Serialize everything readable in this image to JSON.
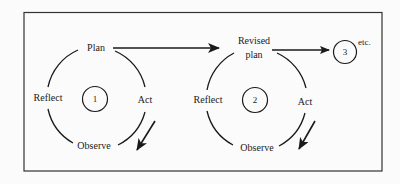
{
  "diagram": {
    "type": "action-research-spiral",
    "colors": {
      "stroke": "#1a1a1a",
      "background": "#fbfbfb"
    },
    "cycles": [
      {
        "id": "1",
        "labels": {
          "plan": "Plan",
          "act": "Act",
          "observe": "Observe",
          "reflect": "Reflect"
        }
      },
      {
        "id": "2",
        "labels": {
          "plan_line1": "Revised",
          "plan_line2": "plan",
          "act": "Act",
          "observe": "Observe",
          "reflect": "Reflect"
        }
      },
      {
        "id": "3",
        "suffix": "etc."
      }
    ],
    "edges": [
      {
        "from": "Plan",
        "to": "Revised plan"
      },
      {
        "from": "Revised plan",
        "to": "3"
      }
    ]
  }
}
